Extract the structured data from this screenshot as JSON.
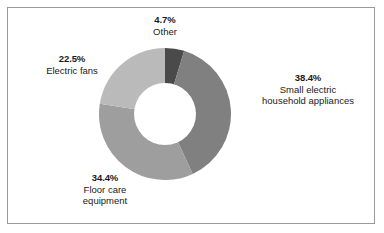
{
  "chart_data": {
    "type": "pie",
    "variant": "donut",
    "title": "",
    "subtitle": "",
    "xlabel": "",
    "ylabel": "",
    "grid": false,
    "legend": "none",
    "labels_position": "outside-callouts",
    "value_unit": "percent",
    "total": 100.0,
    "start_angle_deg": 0,
    "direction": "clockwise",
    "categories": [
      "Other",
      "Small electric household appliances",
      "Floor care equipment",
      "Electric fans"
    ],
    "values": [
      4.7,
      38.4,
      34.4,
      22.5
    ],
    "value_labels": [
      "4.7%",
      "38.4%",
      "34.4%",
      "22.5%"
    ],
    "colors": [
      "#4a4a4a",
      "#808080",
      "#9e9e9e",
      "#bababa"
    ],
    "slices": [
      {
        "name": "Other",
        "value": 4.7,
        "value_label": "4.7%",
        "color": "#4a4a4a",
        "label_lines": [
          "Other"
        ],
        "start_deg": 0.0,
        "end_deg": 16.92
      },
      {
        "name": "Small electric household appliances",
        "value": 38.4,
        "value_label": "38.4%",
        "color": "#808080",
        "label_lines": [
          "Small electric",
          "household appliances"
        ],
        "start_deg": 16.92,
        "end_deg": 155.16
      },
      {
        "name": "Floor care equipment",
        "value": 34.4,
        "value_label": "34.4%",
        "color": "#9e9e9e",
        "label_lines": [
          "Floor care",
          "equipment"
        ],
        "start_deg": 155.16,
        "end_deg": 279.0
      },
      {
        "name": "Electric fans",
        "value": 22.5,
        "value_label": "22.5%",
        "color": "#bababa",
        "label_lines": [
          "Electric fans"
        ],
        "start_deg": 279.0,
        "end_deg": 360.0
      }
    ]
  },
  "callouts": {
    "other": {
      "pct": "4.7%",
      "line1": "Other",
      "line2": ""
    },
    "small_appliances": {
      "pct": "38.4%",
      "line1": "Small electric",
      "line2": "household appliances"
    },
    "electric_fans": {
      "pct": "22.5%",
      "line1": "Electric fans",
      "line2": ""
    },
    "floor_care": {
      "pct": "34.4%",
      "line1": "Floor care",
      "line2": "equipment"
    }
  },
  "style": {
    "background": "#ffffff",
    "frame_color": "#9a9a9a",
    "text_color": "#1a1a1a"
  }
}
